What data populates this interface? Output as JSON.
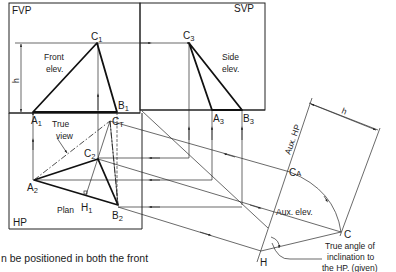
{
  "planes": {
    "fvp": "FVP",
    "svp": "SVP",
    "hp": "HP",
    "aux_hp": "Aux. HP"
  },
  "views": {
    "front_elev_line1": "Front",
    "front_elev_line2": "elev.",
    "side_elev_line1": "Side",
    "side_elev_line2": "elev.",
    "true_view_line1": "True",
    "true_view_line2": "view",
    "plan": "Plan",
    "aux_elev": "Aux. elev."
  },
  "points": {
    "A1": {
      "base": "A",
      "sub": "1"
    },
    "B1": {
      "base": "B",
      "sub": "1"
    },
    "C1": {
      "base": "C",
      "sub": "1"
    },
    "A2": {
      "base": "A",
      "sub": "2"
    },
    "B2": {
      "base": "B",
      "sub": "2"
    },
    "C2": {
      "base": "C",
      "sub": "2"
    },
    "A3": {
      "base": "A",
      "sub": "3"
    },
    "B3": {
      "base": "B",
      "sub": "3"
    },
    "C3": {
      "base": "C",
      "sub": "3"
    },
    "CT": {
      "base": "C",
      "sub": "T"
    },
    "CA": {
      "base": "C",
      "sub": "A"
    },
    "H1": {
      "base": "H",
      "sub": "1"
    },
    "C": {
      "base": "C",
      "sub": ""
    },
    "H": {
      "base": "H",
      "sub": ""
    }
  },
  "dimensions": {
    "h_left": "h",
    "h_right": "h"
  },
  "annotations": {
    "angle_line1": "True angle of",
    "angle_line2": "inclination to",
    "angle_line3": "the HP. (given)"
  },
  "caption_fragment": "n be positioned in both the front",
  "colors": {
    "ink": "#111111",
    "background": "#ffffff"
  }
}
